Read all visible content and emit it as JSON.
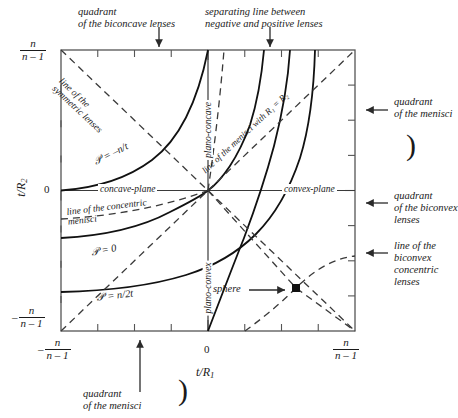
{
  "figure": {
    "type": "diagram",
    "axes": {
      "x_label": "t/R",
      "x_label_sub": "1",
      "y_label": "t/R",
      "y_label_sub": "2",
      "x_ticks": [
        {
          "pos": 0.0,
          "label_num": "n",
          "label_den": "n – 1",
          "sign": "–"
        },
        {
          "pos": 0.5,
          "label_num": "0",
          "label_den": "",
          "sign": ""
        },
        {
          "pos": 1.0,
          "label_num": "n",
          "label_den": "n – 1",
          "sign": ""
        }
      ],
      "y_ticks": [
        {
          "pos": 1.0,
          "label_num": "n",
          "label_den": "n – 1",
          "sign": ""
        },
        {
          "pos": 0.5,
          "label_num": "0",
          "label_den": "",
          "sign": ""
        },
        {
          "pos": 0.0,
          "label_num": "n",
          "label_den": "n – 1",
          "sign": "–"
        }
      ],
      "tick_divisions": 8,
      "grid": false
    },
    "annotations": {
      "top_left": "quadrant\nof the biconcave lenses",
      "top_left_line1": "quadrant",
      "top_left_line2": "of the biconcave lenses",
      "top_right_line1": "separating line between",
      "top_right_line2": "negative and  positive lenses",
      "right_1_line1": "quadrant",
      "right_1_line2": "of the menisci",
      "right_2_line1": "quadrant",
      "right_2_line2": "of the biconvex",
      "right_2_line3": "lenses",
      "right_3_line1": "line of the",
      "right_3_line2": "biconvex",
      "right_3_line3": "concentric",
      "right_3_line4": "lenses",
      "bottom_line1": "quadrant",
      "bottom_line2": "of the menisci"
    },
    "inline_labels": {
      "symmetric_line_1": "line of the",
      "symmetric_line_2": "symmetric lenses",
      "concentric_line_1": "line of the concentric",
      "concentric_line_2": "menisci",
      "menisci_R1R2": "line of the menisci with R₁ = R₂",
      "concave_plane": "concave-plane",
      "convex_plane": "convex-plane",
      "plano_concave": "plano-concave",
      "plano_convex": "plano-convex",
      "power_top": "𝒫 = –n/t",
      "power_mid": "𝒫 = 0",
      "power_bot": "𝒫 = n/2t",
      "sphere": "sphere"
    },
    "markers": [
      {
        "name": "sphere-point",
        "x_px": 296,
        "y_px": 288,
        "shape": "square",
        "color": "#111111"
      }
    ],
    "colors": {
      "axis": "#3a3a3a",
      "curve": "#111111",
      "dashed": "#3a3a3a",
      "text": "#1a1a1a",
      "background": "#ffffff"
    }
  }
}
